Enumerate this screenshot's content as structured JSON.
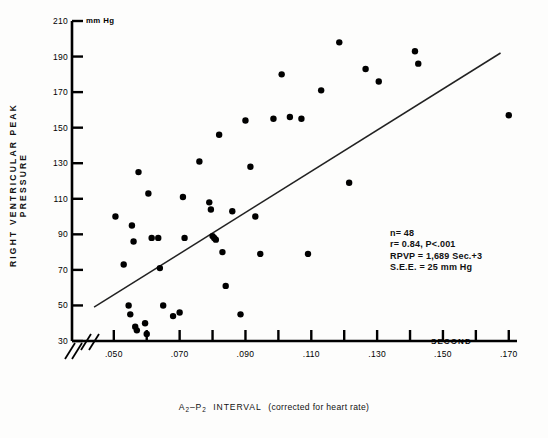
{
  "chart_data": {
    "type": "scatter",
    "title": "",
    "xlabel": "A2-P2 INTERVAL  (corrected for heart rate)",
    "ylabel": "RIGHT VENTRICULAR PEAK PRESSURE",
    "y_unit_label": "mm Hg",
    "x_unit_label": "SECOND",
    "xlim": [
      0.042,
      0.172
    ],
    "ylim": [
      28,
      212
    ],
    "grid": false,
    "legend": "none",
    "axis_break_x": true,
    "axis_break_y": true,
    "xticks": [
      0.05,
      0.06,
      0.07,
      0.08,
      0.09,
      0.1,
      0.11,
      0.12,
      0.13,
      0.14,
      0.15,
      0.16,
      0.17
    ],
    "xticklabels": [
      ".050",
      "",
      ".070",
      "",
      ".090",
      "",
      ".110",
      "",
      ".130",
      "",
      ".150",
      "",
      ".170"
    ],
    "yticks": [
      30,
      50,
      70,
      90,
      110,
      130,
      150,
      170,
      190,
      210
    ],
    "yticklabels": [
      "30",
      "50",
      "70",
      "90",
      "110",
      "130",
      "150",
      "170",
      "190",
      "210"
    ],
    "series": [
      {
        "name": "patients",
        "n": 48,
        "marker": "filled-circle",
        "color": "#000000",
        "points": [
          [
            0.0505,
            100
          ],
          [
            0.053,
            73
          ],
          [
            0.0555,
            95
          ],
          [
            0.056,
            86
          ],
          [
            0.0545,
            50
          ],
          [
            0.055,
            45
          ],
          [
            0.0565,
            38
          ],
          [
            0.057,
            36
          ],
          [
            0.0595,
            40
          ],
          [
            0.06,
            34
          ],
          [
            0.0605,
            113
          ],
          [
            0.0575,
            125
          ],
          [
            0.0615,
            88
          ],
          [
            0.0635,
            88
          ],
          [
            0.064,
            71
          ],
          [
            0.065,
            50
          ],
          [
            0.07,
            46
          ],
          [
            0.068,
            44
          ],
          [
            0.071,
            111
          ],
          [
            0.0715,
            88
          ],
          [
            0.076,
            131
          ],
          [
            0.079,
            108
          ],
          [
            0.0795,
            104
          ],
          [
            0.08,
            89
          ],
          [
            0.0805,
            88
          ],
          [
            0.081,
            87
          ],
          [
            0.082,
            146
          ],
          [
            0.083,
            80
          ],
          [
            0.084,
            61
          ],
          [
            0.086,
            103
          ],
          [
            0.0885,
            45
          ],
          [
            0.09,
            154
          ],
          [
            0.0915,
            128
          ],
          [
            0.093,
            100
          ],
          [
            0.0945,
            79
          ],
          [
            0.0985,
            155
          ],
          [
            0.101,
            180
          ],
          [
            0.1035,
            156
          ],
          [
            0.107,
            155
          ],
          [
            0.109,
            79
          ],
          [
            0.113,
            171
          ],
          [
            0.1185,
            198
          ],
          [
            0.1215,
            119
          ],
          [
            0.1265,
            183
          ],
          [
            0.1305,
            176
          ],
          [
            0.1415,
            193
          ],
          [
            0.1425,
            186
          ],
          [
            0.17,
            157
          ]
        ]
      }
    ],
    "regression_line": {
      "equation_label": "RPVP = 1,689 Sec.+3",
      "x_start": 0.044,
      "y_start": 49,
      "x_end": 0.1675,
      "y_end": 192
    },
    "annotations": {
      "n_label": "n= 48",
      "r_label": "r= 0.84, P<.001",
      "equation": "RPVP = 1,689 Sec.+3",
      "see": "S.E.E. = 25 mm Hg"
    }
  },
  "figure": {
    "caption": ""
  }
}
